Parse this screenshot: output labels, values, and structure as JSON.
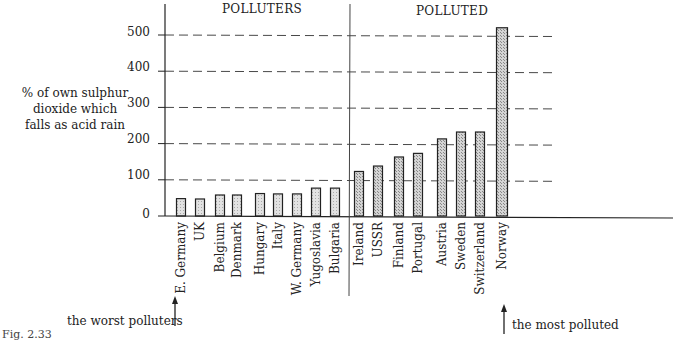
{
  "chart_data": {
    "type": "bar",
    "title": "",
    "ylabel": "% of own sulphur dioxide which falls as acid rain",
    "xlabel": "",
    "ylim": [
      0,
      520
    ],
    "yticks": [
      0,
      100,
      200,
      300,
      400,
      500
    ],
    "grid": "dashed horizontal",
    "groups": [
      {
        "name": "POLLUTERS",
        "categories": [
          "E. Germany",
          "UK",
          "Belgium",
          "Denmark",
          "Hungary",
          "Italy",
          "W. Germany",
          "Yugoslavia",
          "Bulgaria"
        ],
        "values": [
          48,
          47,
          58,
          58,
          62,
          61,
          61,
          77,
          77
        ]
      },
      {
        "name": "POLLUTED",
        "categories": [
          "Ireland",
          "USSR",
          "Finland",
          "Portugal",
          "Austria",
          "Sweden",
          "Switzerland",
          "Norway"
        ],
        "values": [
          123,
          138,
          163,
          173,
          213,
          232,
          232,
          520
        ]
      }
    ],
    "categories": [
      "E. Germany",
      "UK",
      "Belgium",
      "Denmark",
      "Hungary",
      "Italy",
      "W. Germany",
      "Yugoslavia",
      "Bulgaria",
      "Ireland",
      "USSR",
      "Finland",
      "Portugal",
      "Austria",
      "Sweden",
      "Switzerland",
      "Norway"
    ],
    "values": [
      48,
      47,
      58,
      58,
      62,
      61,
      61,
      77,
      77,
      123,
      138,
      163,
      173,
      213,
      232,
      232,
      520
    ],
    "annotations": [
      "the worst polluters",
      "the most polluted"
    ]
  },
  "labels": {
    "ytitle_lines": [
      "% of own sulphur",
      "dioxide which",
      "falls as acid rain"
    ],
    "section_left": "POLLUTERS",
    "section_right": "POLLUTED",
    "note_left": "the worst polluters",
    "note_right": "the most polluted",
    "figure": "Fig. 2.33",
    "yticks": [
      "0",
      "100",
      "200",
      "300",
      "400",
      "500"
    ]
  }
}
